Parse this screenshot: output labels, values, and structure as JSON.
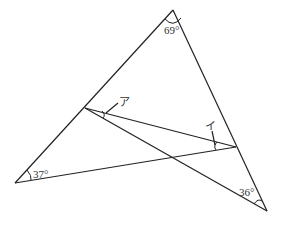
{
  "diagram": {
    "points": {
      "A": [
        173,
        10
      ],
      "B": [
        15,
        183
      ],
      "C": [
        267,
        211
      ],
      "D": [
        85,
        108
      ],
      "E": [
        236,
        147
      ]
    },
    "angle_labels": {
      "apex": "69°",
      "left": "37°",
      "bottom_right": "36°",
      "a": "ア",
      "i": "イ"
    },
    "colors": {
      "stroke": "#222222",
      "background": "#ffffff"
    }
  }
}
